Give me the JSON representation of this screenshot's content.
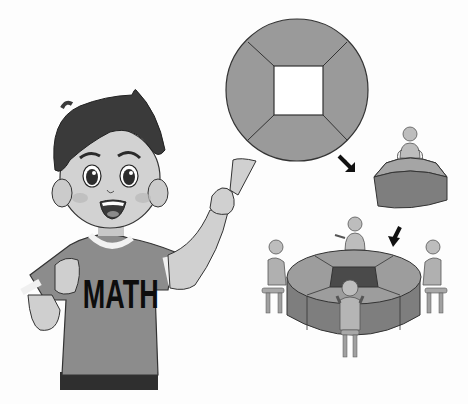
{
  "scene": {
    "description": "Grayscale illustration: boy pointing at a ring-shaped table diagram split into 4 trapezoid segments, arrows leading to a single segment with a person and then to the assembled ring table with 4 people",
    "shirt_text": "MATH"
  },
  "colors": {
    "background": "#fdfdfd",
    "segment_fill": "#9a9a9a",
    "segment_side": "#7e7e7e",
    "outline": "#333333",
    "hole": "#ffffff",
    "hole_dark": "#4a4a4a",
    "skin": "#cfcfcf",
    "hair": "#3a3a3a",
    "shirt": "#8c8c8c",
    "arrow": "#111111"
  },
  "diagram": {
    "top_view": {
      "cx": 297,
      "cy": 90,
      "r": 71,
      "segments": 4,
      "hole": "square"
    },
    "single_segment": {
      "people": 1
    },
    "assembled_table": {
      "people": 4,
      "segments": 4
    }
  }
}
